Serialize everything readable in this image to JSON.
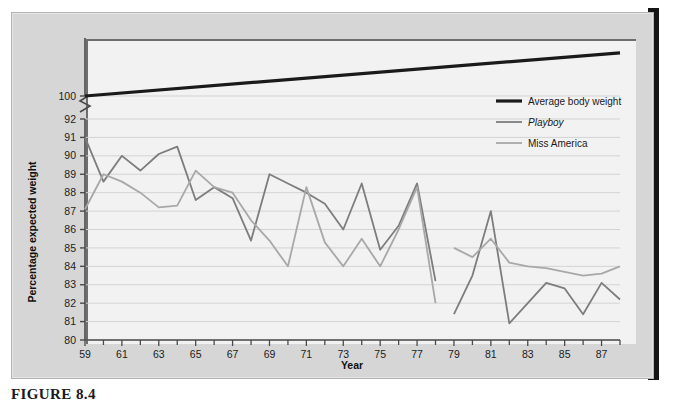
{
  "figure": {
    "caption": "FIGURE 8.4",
    "background_color": "#d6d6d6",
    "plot_background_color": "#f2f2f2"
  },
  "chart_data": {
    "type": "line",
    "title": "",
    "xlabel": "Year",
    "ylabel": "Percentage expected weight",
    "xlim": [
      59,
      88
    ],
    "ylim": [
      80,
      92
    ],
    "y_break": {
      "present": true,
      "below": 92,
      "above": 100,
      "note": "axis break between 92 and 100"
    },
    "grid": true,
    "grid_axis": "y",
    "legend_position": "upper right",
    "xticks": [
      59,
      60,
      61,
      62,
      63,
      64,
      65,
      66,
      67,
      68,
      69,
      70,
      71,
      72,
      73,
      74,
      75,
      76,
      77,
      78,
      79,
      80,
      81,
      82,
      83,
      84,
      85,
      86,
      87,
      88
    ],
    "xtick_labels": [
      "59",
      "",
      "61",
      "",
      "63",
      "",
      "65",
      "",
      "67",
      "",
      "69",
      "",
      "71",
      "",
      "73",
      "",
      "75",
      "",
      "77",
      "",
      "79",
      "",
      "81",
      "",
      "83",
      "",
      "85",
      "",
      "87",
      ""
    ],
    "yticks": [
      80,
      81,
      82,
      83,
      84,
      85,
      86,
      87,
      88,
      89,
      90,
      91,
      92,
      100
    ],
    "ytick_labels": [
      "80",
      "81",
      "82",
      "83",
      "84",
      "85",
      "86",
      "87",
      "88",
      "89",
      "90",
      "91",
      "92",
      "100"
    ],
    "series": [
      {
        "name": "Average body weight",
        "color": "#1a1a1a",
        "width": 3.2,
        "italic": false,
        "x": [
          59,
          88
        ],
        "values": [
          100.0,
          100.6
        ]
      },
      {
        "name": "Playboy",
        "color": "#7d7d7d",
        "width": 1.8,
        "italic": true,
        "x": [
          59,
          60,
          61,
          62,
          63,
          64,
          65,
          66,
          67,
          68,
          69,
          70,
          71,
          72,
          73,
          74,
          75,
          76,
          77,
          78,
          79,
          80,
          81,
          82,
          83,
          84,
          85,
          86,
          87,
          88
        ],
        "values": [
          91.0,
          88.6,
          90.0,
          89.2,
          90.1,
          90.5,
          87.6,
          88.3,
          87.7,
          85.4,
          89.0,
          88.5,
          88.0,
          87.4,
          86.0,
          88.5,
          84.9,
          86.2,
          88.5,
          83.2,
          81.4,
          83.5,
          87.0,
          80.9,
          82.0,
          83.1,
          82.8,
          81.4,
          83.1,
          82.2
        ]
      },
      {
        "name": "Miss America",
        "color": "#a8a8a8",
        "width": 1.8,
        "italic": false,
        "x": [
          59,
          60,
          61,
          62,
          63,
          64,
          65,
          66,
          67,
          68,
          69,
          70,
          71,
          72,
          73,
          74,
          75,
          76,
          77,
          78,
          79,
          80,
          81,
          82,
          83,
          84,
          85,
          86,
          87,
          88
        ],
        "values": [
          87.1,
          89.0,
          88.6,
          88.0,
          87.2,
          87.3,
          89.2,
          88.3,
          88.0,
          86.5,
          85.4,
          84.0,
          88.3,
          85.3,
          84.0,
          85.5,
          84.0,
          86.0,
          88.3,
          82.0,
          85.0,
          84.5,
          85.5,
          84.2,
          84.0,
          83.9,
          83.7,
          83.5,
          83.6,
          84.0
        ]
      }
    ],
    "series_gaps": [
      {
        "series": "Playboy",
        "between": [
          78,
          79
        ]
      },
      {
        "series": "Miss America",
        "between": [
          78,
          79
        ]
      }
    ],
    "legend_entries": [
      {
        "label": "Average body weight",
        "color": "#1a1a1a",
        "italic": false
      },
      {
        "label": "Playboy",
        "color": "#7d7d7d",
        "italic": true
      },
      {
        "label": "Miss America",
        "color": "#a8a8a8",
        "italic": false
      }
    ]
  }
}
